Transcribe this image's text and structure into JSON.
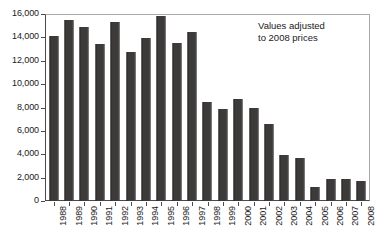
{
  "chart_data": {
    "type": "bar",
    "title": "",
    "xlabel": "",
    "ylabel": "",
    "ylim": [
      0,
      16000
    ],
    "yticks": [
      "0",
      "2,000",
      "4,000",
      "6,000",
      "8,000",
      "10,000",
      "12,000",
      "14,000",
      "16,000"
    ],
    "ytick_values": [
      0,
      2000,
      4000,
      6000,
      8000,
      10000,
      12000,
      14000,
      16000
    ],
    "grid": false,
    "legend": null,
    "annotations": [
      "Values adjusted\nto 2008 prices"
    ],
    "categories": [
      "1988",
      "1989",
      "1990",
      "1991",
      "1992",
      "1993",
      "1994",
      "1995",
      "1996",
      "1997",
      "1998",
      "1999",
      "2000",
      "2001",
      "2002",
      "2003",
      "2004",
      "2005",
      "2006",
      "2007",
      "2008"
    ],
    "values": [
      14200,
      15600,
      15000,
      13500,
      15400,
      12800,
      14000,
      15900,
      13600,
      14500,
      8500,
      7900,
      8800,
      8000,
      6600,
      4000,
      3700,
      1200,
      1900,
      1900,
      1700
    ],
    "bar_color": "#3d3a3a"
  },
  "annotation": {
    "text": "Values adjusted\nto 2008 prices"
  },
  "axes": {
    "y_labels": [
      "16,000",
      "14,000",
      "12,000",
      "10,000",
      "8,000",
      "6,000",
      "4,000",
      "2,000",
      "0"
    ],
    "x_labels": [
      "1988",
      "1989",
      "1990",
      "1991",
      "1992",
      "1993",
      "1994",
      "1995",
      "1996",
      "1997",
      "1998",
      "1999",
      "2000",
      "2001",
      "2002",
      "2003",
      "2004",
      "2005",
      "2006",
      "2007",
      "2008"
    ]
  },
  "title": {
    "text": ""
  }
}
